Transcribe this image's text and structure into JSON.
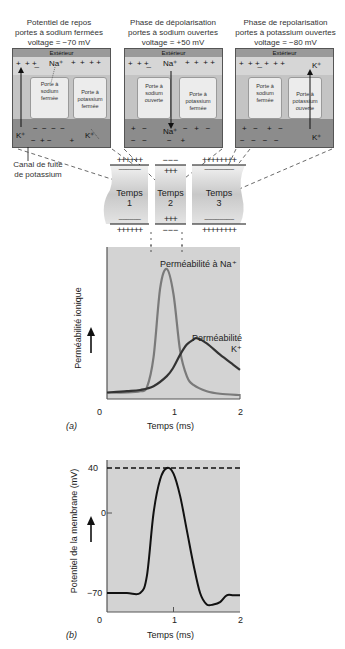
{
  "panels": [
    {
      "id": "rest",
      "caption": [
        "Potentiel de repos",
        "portes à sodium fermées",
        "voltage = −70 mV"
      ],
      "exterior_label": "Extérieur",
      "top_ion": "Na⁺",
      "bottom_ions": [
        "K⁺",
        "K⁺"
      ],
      "gate_left": [
        "Porte à",
        "sodium",
        "fermée"
      ],
      "gate_right": [
        "Porte à",
        "potassium",
        "fermée"
      ],
      "top_signs": "+ + + _ Na⁺ + + + + +",
      "bottom_signs": "− − − − + − − + −"
    },
    {
      "id": "depolarization",
      "caption": [
        "Phase de dépolarisation",
        "portes à sodium ouvertes",
        "voltage = +50 mV"
      ],
      "exterior_label": "Extérieur",
      "top_ion": "Na⁺",
      "bottom_ion": "Na⁺",
      "gate_left": [
        "Porte à",
        "sodium",
        "ouverte"
      ],
      "gate_right": [
        "Porte à",
        "potassium",
        "fermée"
      ]
    },
    {
      "id": "repolarization",
      "caption": [
        "Phase de repolarisation",
        "portes à potassium ouvertes",
        "voltage = −80 mV"
      ],
      "exterior_label": "Extérieur",
      "top_ion": "K⁺",
      "bottom_ion": "K⁺",
      "gate_left": [
        "Porte à",
        "sodium",
        "fermée"
      ],
      "gate_right": [
        "Porte à",
        "potassium",
        "ouverte"
      ]
    }
  ],
  "leak_channel_label": [
    "Canal de fuite",
    "de potassium"
  ],
  "axon": {
    "segments": [
      {
        "label": [
          "Temps",
          "1"
        ],
        "top_outer": "++++++",
        "top_inner": "−−−−−−",
        "bottom_inner": "−−−−−−",
        "bottom_outer": "++++++"
      },
      {
        "label": [
          "Temps",
          "2"
        ],
        "top_outer": "−−−",
        "top_inner": "+++",
        "bottom_inner": "+++",
        "bottom_outer": "−−−"
      },
      {
        "label": [
          "Temps",
          "3"
        ],
        "top_outer": "++++++++",
        "top_inner": "−−−−−−−−",
        "bottom_inner": "−−−−−−−−",
        "bottom_outer": "++++++++"
      }
    ]
  },
  "chart_data": [
    {
      "type": "line",
      "panel_label": "(a)",
      "title": "",
      "xlabel": "Temps (ms)",
      "ylabel": "Perméabilité ionique",
      "xlim": [
        0,
        2
      ],
      "x_ticks": [
        "0",
        "1",
        "2"
      ],
      "grid": false,
      "background": "#d3d3d3",
      "series": [
        {
          "name": "Perméabilité à Na⁺",
          "color": "#7a7a7a",
          "x": [
            0,
            0.3,
            0.5,
            0.6,
            0.7,
            0.8,
            0.9,
            1.0,
            1.1,
            1.2,
            1.3,
            1.5,
            1.7,
            2.0
          ],
          "y": [
            0.02,
            0.02,
            0.03,
            0.06,
            0.3,
            0.85,
            1.0,
            0.8,
            0.35,
            0.15,
            0.08,
            0.03,
            0.01,
            0.0
          ]
        },
        {
          "name": "Perméabilité K⁺",
          "color": "#333333",
          "x": [
            0,
            0.3,
            0.5,
            0.7,
            0.9,
            1.0,
            1.1,
            1.2,
            1.3,
            1.35,
            1.5,
            1.7,
            1.9,
            2.0
          ],
          "y": [
            0.02,
            0.03,
            0.04,
            0.07,
            0.15,
            0.22,
            0.32,
            0.4,
            0.44,
            0.45,
            0.41,
            0.32,
            0.24,
            0.2
          ]
        }
      ]
    },
    {
      "type": "line",
      "panel_label": "(b)",
      "title": "",
      "xlabel": "Temps (ms)",
      "ylabel": "Potentiel de la membrane (mV)",
      "xlim": [
        0,
        2
      ],
      "ylim": [
        -85,
        45
      ],
      "x_ticks": [
        "0",
        "1",
        "2"
      ],
      "y_ticks": [
        "40",
        "0",
        "−70"
      ],
      "reference_line": {
        "y": 40,
        "style": "dashed"
      },
      "grid": false,
      "background": "#d3d3d3",
      "series": [
        {
          "name": "Potentiel de membrane",
          "color": "#111111",
          "x": [
            0,
            0.3,
            0.5,
            0.6,
            0.7,
            0.8,
            0.9,
            1.0,
            1.1,
            1.2,
            1.3,
            1.4,
            1.5,
            1.6,
            1.7,
            1.8,
            1.9,
            2.0
          ],
          "y": [
            -70,
            -70,
            -70,
            -55,
            0,
            30,
            40,
            35,
            15,
            -15,
            -45,
            -70,
            -80,
            -80,
            -78,
            -72,
            -72,
            -72
          ]
        }
      ]
    }
  ]
}
